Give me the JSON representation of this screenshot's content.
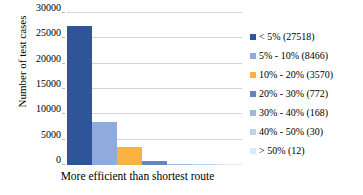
{
  "chart_data": {
    "type": "bar",
    "title": "",
    "xlabel": "More efficient than shortest route",
    "ylabel": "Number of test cases",
    "categories": [
      "< 5%",
      "5% - 10%",
      "10% - 20%",
      "20% - 30%",
      "30% - 40%",
      "40% - 50%",
      "> 50%"
    ],
    "values": [
      27518,
      8466,
      3570,
      772,
      168,
      30,
      12
    ],
    "colors": [
      "#2E5597",
      "#8FAADC",
      "#F9B241",
      "#6186C6",
      "#A3B6DC",
      "#BDD2EC",
      "#DCEAF5"
    ],
    "ylim": [
      0,
      30000
    ],
    "yticks": [
      0,
      5000,
      10000,
      15000,
      20000,
      25000,
      30000
    ],
    "ytick_labels": [
      "0",
      "5000",
      "10000",
      "15000",
      "20000",
      "25000",
      "30000"
    ],
    "grid": true,
    "legend_position": "right",
    "legend": [
      {
        "label": "< 5% (27518)",
        "color": "#2E5597",
        "value": 27518
      },
      {
        "label": "5% - 10% (8466)",
        "color": "#8FAADC",
        "value": 8466
      },
      {
        "label": "10% - 20% (3570)",
        "color": "#F9B241",
        "value": 3570
      },
      {
        "label": "20% - 30% (772)",
        "color": "#6186C6",
        "value": 772
      },
      {
        "label": "30% - 40% (168)",
        "color": "#A3B6DC",
        "value": 168
      },
      {
        "label": "40% - 50% (30)",
        "color": "#BDD2EC",
        "value": 30
      },
      {
        "label": "> 50% (12)",
        "color": "#DCEAF5",
        "value": 12
      }
    ]
  }
}
